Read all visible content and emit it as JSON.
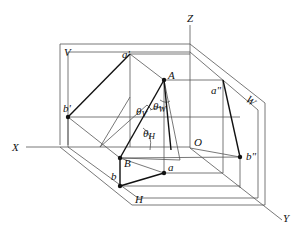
{
  "diagram": {
    "type": "orthographic-projection-axonometric",
    "planes": {
      "V": "V",
      "H": "H",
      "W": "W"
    },
    "axes": {
      "X": "X",
      "Y": "Y",
      "Z": "Z",
      "O": "O"
    },
    "points": {
      "A": "A",
      "B": "B",
      "a_v": "a'",
      "b_v": "b'",
      "a_h": "a",
      "b_h": "b",
      "a_w": "a\"",
      "b_w": "b\""
    },
    "angles": {
      "theta_V": "θ",
      "theta_V_sub": "V",
      "theta_W": "θ",
      "theta_W_sub": "W",
      "theta_H": "θ",
      "theta_H_sub": "H"
    }
  }
}
